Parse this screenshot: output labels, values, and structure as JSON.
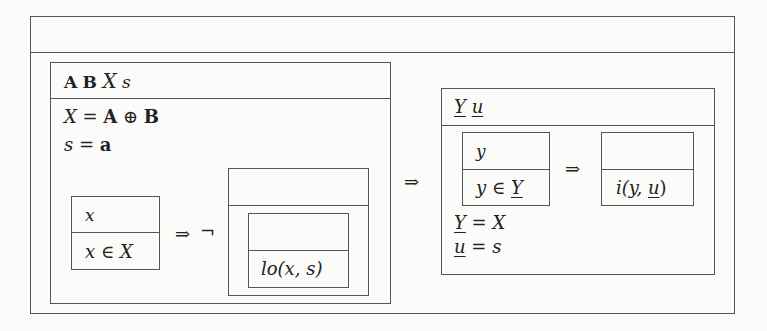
{
  "diagram": {
    "outer_box": {
      "header": ""
    },
    "left_box": {
      "declaration": {
        "A": "A",
        "B": "B",
        "X": "X",
        "s": "s"
      },
      "predicates": [
        {
          "lhs": "X",
          "op": " = ",
          "rhs_a": "A",
          "oplus": " ⊕ ",
          "rhs_b": "B"
        },
        {
          "lhs": "s",
          "op": " = ",
          "rhs": "a"
        }
      ],
      "quant_box": {
        "decl": "x",
        "pred_var": "x",
        "pred_op": " ∈ ",
        "pred_set": "X"
      },
      "implies": "⇒",
      "negation": "¬",
      "negated_box": {
        "header": "",
        "inner_box": {
          "decl": "",
          "pred": "lo(x, s)"
        }
      }
    },
    "implies_main": "⇒",
    "right_box": {
      "declaration": {
        "Y": "Y",
        "u": "u"
      },
      "quant_box": {
        "decl": "y",
        "pred_var": "y",
        "pred_op": " ∈ ",
        "pred_set": "Y"
      },
      "implies": "⇒",
      "result_box": {
        "decl": "",
        "pred": "i(y, u)",
        "pred_prefix": "i(y, ",
        "pred_u": "u",
        "pred_suffix": ")"
      },
      "predicates": [
        {
          "lhs": "Y",
          "op": " = ",
          "rhs": "X"
        },
        {
          "lhs": "u",
          "op": " = ",
          "rhs": "s"
        }
      ]
    }
  }
}
